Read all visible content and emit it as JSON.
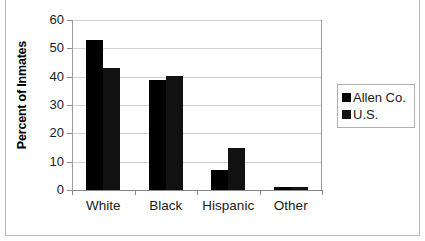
{
  "chart_data": {
    "type": "bar",
    "title": "",
    "xlabel": "",
    "ylabel": "Percent of Inmates",
    "categories": [
      "White",
      "Black",
      "Hispanic",
      "Other"
    ],
    "series": [
      {
        "name": "Allen Co.",
        "color": "#000000",
        "values": [
          53,
          39,
          7,
          1
        ]
      },
      {
        "name": "U.S.",
        "color": "#111111",
        "values": [
          43,
          40.3,
          14.8,
          1.2
        ]
      }
    ],
    "ylim": [
      0,
      60
    ],
    "yticks": [
      0,
      10,
      20,
      30,
      40,
      50,
      60
    ],
    "ytick_labels": [
      "0",
      "10",
      "20",
      "30",
      "40",
      "50",
      "60"
    ],
    "grid": "horizontal",
    "legend_position": "right"
  },
  "legend": {
    "items": [
      {
        "label": "Allen Co.",
        "swatch": "#000000"
      },
      {
        "label": "U.S.",
        "swatch": "#111111"
      }
    ]
  },
  "colors": {
    "background": "#ffffff",
    "axis": "#8a8a8a",
    "gridline": "#d2d2d2",
    "frame": "#b9b9b9",
    "text": "#1a1a1a"
  }
}
